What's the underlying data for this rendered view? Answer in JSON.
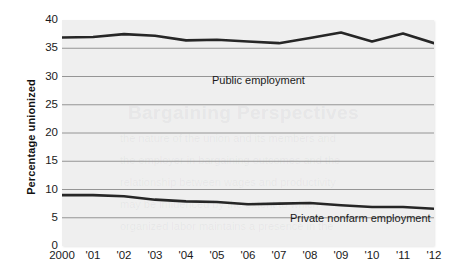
{
  "chart_data": {
    "type": "line",
    "title": "",
    "xlabel": "",
    "ylabel": "Percentage unionized",
    "x": [
      2000,
      2001,
      2002,
      2003,
      2004,
      2005,
      2006,
      2007,
      2008,
      2009,
      2010,
      2011,
      2012
    ],
    "xtick_labels": [
      "2000",
      "'01",
      "'02",
      "'03",
      "'04",
      "'05",
      "'06",
      "'07",
      "'08",
      "'09",
      "'10",
      "'11",
      "'12"
    ],
    "ytick_labels": [
      "0",
      "5",
      "10",
      "15",
      "20",
      "25",
      "30",
      "35",
      "40"
    ],
    "ytick_values": [
      0,
      5,
      10,
      15,
      20,
      25,
      30,
      35,
      40
    ],
    "ylim": [
      0,
      40
    ],
    "grid": true,
    "legend_position": "inline-labels",
    "series": [
      {
        "name": "Public employment",
        "label_text": "Public employment",
        "color": "#262626",
        "values": [
          36.9,
          37.0,
          37.5,
          37.2,
          36.4,
          36.5,
          36.2,
          35.9,
          36.8,
          37.8,
          36.2,
          37.6,
          35.9
        ]
      },
      {
        "name": "Private nonfarm employment",
        "label_text": "Private nonfarm employment",
        "color": "#262626",
        "values": [
          9.0,
          9.0,
          8.8,
          8.2,
          7.9,
          7.8,
          7.4,
          7.5,
          7.6,
          7.2,
          6.9,
          6.9,
          6.6
        ]
      }
    ]
  },
  "axes": {
    "y_title": "Percentage unionized"
  },
  "ghost_text": {
    "heading": "Bargaining Perspectives",
    "lines": [
      "the nature of the union and its members and",
      "the employer in bargaining outcomes and the",
      "relationship between wages and productivity",
      "may be influenced by the extent to which",
      "organized labor maintains a presence in the"
    ]
  },
  "colors": {
    "plot_background": "#efefef",
    "gridline": "#8a8a8a",
    "series_line": "#262626",
    "text": "#1a1a1a"
  }
}
